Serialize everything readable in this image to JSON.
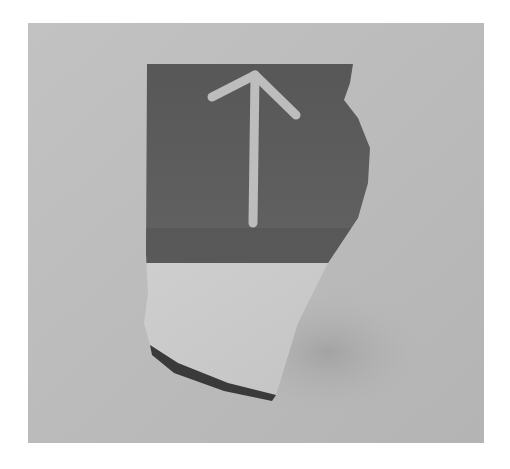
{
  "image": {
    "subject": "pottery shard with incised arrow mark",
    "caption_text_visible": "",
    "colors": {
      "background": "#b9b9b9",
      "glaze_dark": "#5e5e5e",
      "bisque_light": "#cacaca",
      "arrow_mark": "#bdbdbd",
      "edge_shadow": "#3a3a3a"
    }
  }
}
